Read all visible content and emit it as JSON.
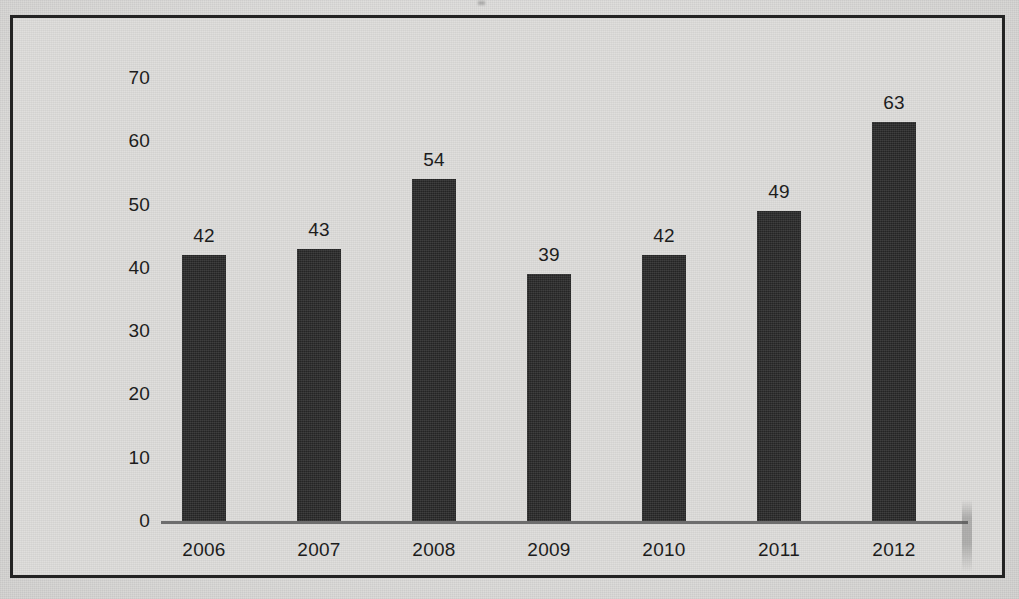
{
  "chart_data": {
    "type": "bar",
    "title": "",
    "subtitle": "",
    "xlabel": "",
    "ylabel": "",
    "categories": [
      "2006",
      "2007",
      "2008",
      "2009",
      "2010",
      "2011",
      "2012"
    ],
    "values": [
      42,
      43,
      54,
      39,
      42,
      49,
      63
    ],
    "data_labels": [
      "42",
      "43",
      "54",
      "39",
      "42",
      "49",
      "63"
    ],
    "ylim": [
      0,
      70
    ],
    "ytick_labels": [
      "0",
      "10",
      "20",
      "30",
      "40",
      "50",
      "60",
      "70"
    ],
    "ytick_values": [
      0,
      10,
      20,
      30,
      40,
      50,
      60,
      70
    ],
    "grid": false,
    "legend": false,
    "legend_position": "none",
    "bar_color": "#2b2b2b",
    "axis_color": "#6d6d6d",
    "border_color": "#232323",
    "background_color": "#dedddb",
    "text_color": "#1d1d1d"
  }
}
